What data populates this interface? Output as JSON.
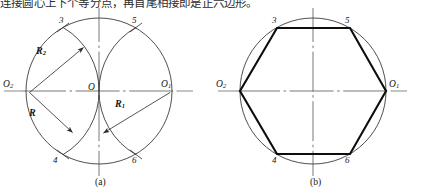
{
  "page": {
    "width": 424,
    "height": 196,
    "background": "#ffffff",
    "ink": "#151515",
    "top_text_fragment": "连接圆心上下个等分点，再首尾相接即是正六边形。"
  },
  "figures": [
    {
      "id": "a",
      "caption": "(a)",
      "caption_x": 101,
      "caption_y": 180,
      "description": "construction arcs",
      "center": {
        "label": "O",
        "x": 99,
        "y": 91
      },
      "radius": 73,
      "points": [
        {
          "label": "O",
          "sub": "",
          "x": 99,
          "y": 91,
          "text_x": 88,
          "text_y": 86
        },
        {
          "label": "O",
          "sub": "1",
          "x": 172,
          "y": 91,
          "text_x": 161,
          "text_y": 83
        },
        {
          "label": "O",
          "sub": "2",
          "x": 27,
          "y": 91,
          "text_x": 4,
          "text_y": 83
        },
        {
          "label": "3",
          "sub": "",
          "x": 63,
          "y": 27,
          "text_x": 59,
          "text_y": 18
        },
        {
          "label": "5",
          "sub": "",
          "x": 136,
          "y": 27,
          "text_x": 132,
          "text_y": 18
        },
        {
          "label": "4",
          "sub": "",
          "x": 63,
          "y": 155,
          "text_x": 54,
          "text_y": 156
        },
        {
          "label": "6",
          "sub": "",
          "x": 136,
          "y": 155,
          "text_x": 132,
          "text_y": 156
        }
      ],
      "radius_labels": [
        {
          "label": "R",
          "sub": "2",
          "text_x": 38,
          "text_y": 51
        },
        {
          "label": "R",
          "sub": "",
          "text_x": 30,
          "text_y": 113
        },
        {
          "label": "R",
          "sub": "1",
          "text_x": 116,
          "text_y": 104
        }
      ]
    },
    {
      "id": "b",
      "caption": "(b)",
      "caption_x": 316,
      "caption_y": 180,
      "description": "inscribed regular hexagon",
      "center": {
        "label": "",
        "x": 313,
        "y": 91
      },
      "radius": 73,
      "points": [
        {
          "label": "O",
          "sub": "1",
          "x": 386,
          "y": 91,
          "text_x": 390,
          "text_y": 83
        },
        {
          "label": "O",
          "sub": "2",
          "x": 240,
          "y": 91,
          "text_x": 216,
          "text_y": 83
        },
        {
          "label": "3",
          "sub": "",
          "x": 277,
          "y": 28,
          "text_x": 272,
          "text_y": 18
        },
        {
          "label": "5",
          "sub": "",
          "x": 350,
          "y": 28,
          "text_x": 345,
          "text_y": 18
        },
        {
          "label": "4",
          "sub": "",
          "x": 277,
          "y": 154,
          "text_x": 272,
          "text_y": 156
        },
        {
          "label": "6",
          "sub": "",
          "x": 350,
          "y": 154,
          "text_x": 345,
          "text_y": 156
        }
      ],
      "hexagon_vertices": "386,91 350,28 277,28 240,91 277,154 350,154"
    }
  ],
  "colors": {
    "outline": "#3a3a3a",
    "hexagon": "#0d0d0d",
    "axis": "#5a5a5a",
    "text": "#151515"
  }
}
